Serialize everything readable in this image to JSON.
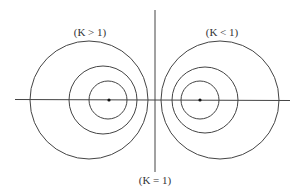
{
  "diagram": {
    "labels": {
      "left": "(K > 1)",
      "right": "(K < 1)",
      "bottom": "(K = 1)"
    },
    "axis_color": "#444444",
    "circle_color": "#444444",
    "left_circles": [
      {
        "cx": 89,
        "cy": 100,
        "r": 59
      },
      {
        "cx": 103,
        "cy": 100,
        "r": 34
      },
      {
        "cx": 108,
        "cy": 100,
        "r": 19
      }
    ],
    "left_point": {
      "cx": 109,
      "cy": 100
    },
    "right_circles": [
      {
        "cx": 220,
        "cy": 100,
        "r": 59
      },
      {
        "cx": 205,
        "cy": 100,
        "r": 33
      },
      {
        "cx": 200,
        "cy": 100,
        "r": 19
      }
    ],
    "right_point": {
      "cx": 200,
      "cy": 100
    }
  }
}
